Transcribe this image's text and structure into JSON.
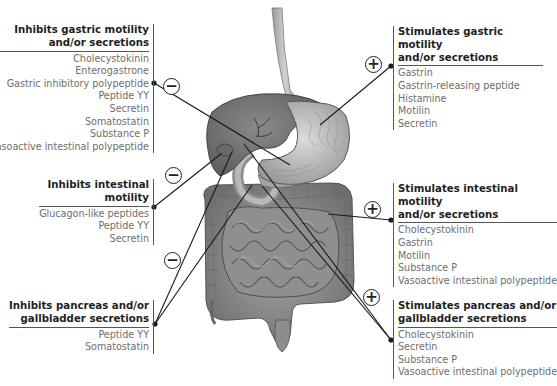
{
  "boxes": {
    "inhibits_gastric": {
      "title_line1": "Inhibits gastric motility",
      "title_line2": "and/or secretions",
      "effect": "inhibit",
      "items": [
        "Cholecystokinin",
        "Enterogastrone",
        "Gastric inhibitory polypeptide",
        "Peptide YY",
        "Secretin",
        "Somatostatin",
        "Substance P",
        "Vasoactive intestinal polypeptide"
      ]
    },
    "stimulates_gastric": {
      "title_line1": "Stimulates gastric motility",
      "title_line2": "and/or secretions",
      "effect": "stimulate",
      "items": [
        "Gastrin",
        "Gastrin-releasing peptide",
        "Histamine",
        "Motilin",
        "Secretin"
      ]
    },
    "inhibits_intestinal": {
      "title_line1": "Inhibits intestinal",
      "title_line2": "motility",
      "effect": "inhibit",
      "items": [
        "Glucagon-like peptides",
        "Peptide YY",
        "Secretin"
      ]
    },
    "stimulates_intestinal": {
      "title_line1": "Stimulates intestinal motility",
      "title_line2": "and/or secretions",
      "effect": "stimulate",
      "items": [
        "Cholecystokinin",
        "Gastrin",
        "Motilin",
        "Substance P",
        "Vasoactive intestinal polypeptide"
      ]
    },
    "inhibits_pancreas": {
      "title_line1": "Inhibits pancreas and/or",
      "title_line2": "gallbladder secretions",
      "effect": "inhibit",
      "items": [
        "Peptide YY",
        "Somatostatin"
      ]
    },
    "stimulates_pancreas": {
      "title_line1": "Stimulates pancreas and/or",
      "title_line2": "gallbladder secretions",
      "effect": "stimulate",
      "items": [
        "Cholecystokinin",
        "Secretin",
        "Substance P",
        "Vasoactive intestinal polypeptide"
      ]
    }
  },
  "signs": {
    "minus": "−",
    "plus": "+"
  },
  "illustration": {
    "subject": "digestive-tract-anatomy",
    "organs": [
      "esophagus",
      "liver",
      "gallbladder",
      "stomach",
      "duodenum",
      "pancreas",
      "small-intestine",
      "large-intestine"
    ]
  }
}
